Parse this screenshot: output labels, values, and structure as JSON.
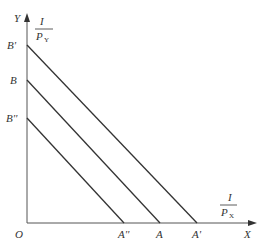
{
  "diagram": {
    "type": "budget-line shift",
    "axes": {
      "origin_label": "O",
      "x_label": "X",
      "y_label": "Y",
      "x_intercept_formula": {
        "numerator": "I",
        "denominator": "P",
        "subscript": "X"
      },
      "y_intercept_formula": {
        "numerator": "I",
        "denominator": "P",
        "subscript": "Y"
      }
    },
    "lines": [
      {
        "name": "B'A'",
        "y_label": "B'",
        "x_label": "A'"
      },
      {
        "name": "BA",
        "y_label": "B",
        "x_label": "A"
      },
      {
        "name": "B''A''",
        "y_label": "B''",
        "x_label": "A''"
      }
    ],
    "colors": {
      "line": "#333333",
      "axis": "#555555"
    }
  }
}
